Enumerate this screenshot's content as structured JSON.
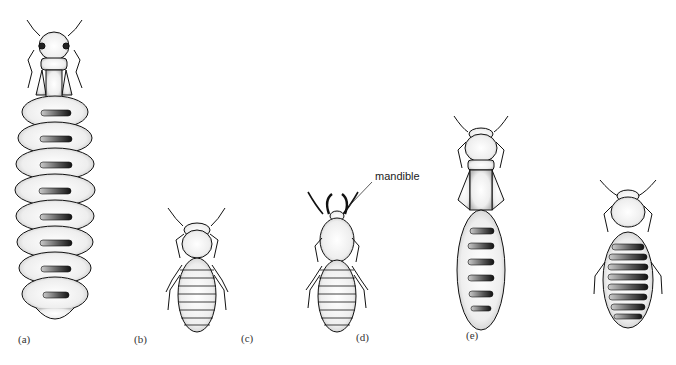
{
  "figure": {
    "panels": [
      {
        "id": "a",
        "label": "(a)"
      },
      {
        "id": "b",
        "label": "(b)"
      },
      {
        "id": "c",
        "label": "(c)"
      },
      {
        "id": "d",
        "label": "(d)"
      },
      {
        "id": "e",
        "label": "(e)"
      }
    ],
    "annotations": {
      "mandible": "mandible"
    }
  }
}
